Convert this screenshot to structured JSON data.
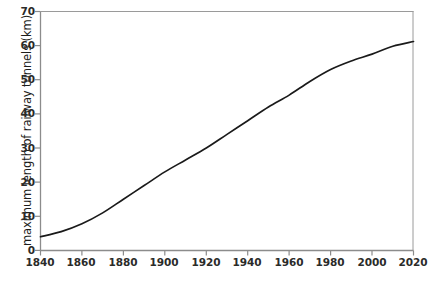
{
  "chart_data": {
    "type": "line",
    "title": "",
    "xlabel": "",
    "ylabel": "maximum length of railway tunnels (km)",
    "xlim": [
      1840,
      2020
    ],
    "ylim": [
      0,
      70
    ],
    "grid": false,
    "legend": null,
    "xticks": [
      1840,
      1860,
      1880,
      1900,
      1920,
      1940,
      1960,
      1980,
      2000,
      2020
    ],
    "yticks": [
      0,
      10,
      20,
      30,
      40,
      50,
      60,
      70
    ],
    "line_color": "#1a1a1a",
    "axis_color": "#8c8c8c",
    "tick_label_color": "#2b2b29",
    "background_color": "#ffffff",
    "series": [
      {
        "name": "maximum length of railway tunnels",
        "x": [
          1840,
          1850,
          1860,
          1870,
          1880,
          1890,
          1900,
          1910,
          1920,
          1930,
          1940,
          1950,
          1960,
          1970,
          1980,
          1990,
          2000,
          2010,
          2020
        ],
        "values": [
          4.0,
          5.5,
          7.8,
          11.0,
          15.0,
          19.0,
          23.0,
          26.5,
          30.0,
          34.0,
          38.0,
          42.0,
          45.5,
          49.5,
          53.0,
          55.5,
          57.5,
          59.8,
          61.2
        ]
      }
    ]
  },
  "axes": {
    "y_title": "maximum length of railway tunnels (km)",
    "y_tick_labels": [
      "70",
      "60",
      "50",
      "40",
      "30",
      "20",
      "10",
      "0"
    ],
    "x_tick_labels": [
      "1840",
      "1860",
      "1880",
      "1900",
      "1920",
      "1940",
      "1960",
      "1980",
      "2000",
      "2020"
    ]
  },
  "caption": {
    "ghost_text": ""
  }
}
